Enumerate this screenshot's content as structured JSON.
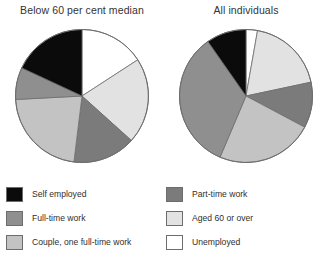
{
  "figure": {
    "background": "#ffffff"
  },
  "charts": [
    {
      "title": "Below 60 per cent median",
      "name": "pie-below-60-per-cent-median"
    },
    {
      "title": "All individuals",
      "name": "pie-all-individuals"
    }
  ],
  "legend": {
    "columns": [
      {
        "items": [
          {
            "label": "Self employed",
            "color": "#0b0b0b",
            "key": "self-employed"
          },
          {
            "label": "Full-time work",
            "color": "#8f8f8f",
            "key": "full-time-work"
          },
          {
            "label": "Couple, one full-time work",
            "color": "#c3c3c3",
            "key": "couple-one-full-time-work"
          }
        ]
      },
      {
        "items": [
          {
            "label": "Part-time work",
            "color": "#7b7b7b",
            "key": "part-time-work"
          },
          {
            "label": "Aged 60 or over",
            "color": "#e2e2e2",
            "key": "aged-60-or-over"
          },
          {
            "label": "Unemployed",
            "color": "#ffffff",
            "key": "unemployed"
          }
        ]
      }
    ]
  },
  "chart_data": {
    "type": "pie",
    "title": "",
    "legend_position": "bottom",
    "categories": [
      "Unemployed",
      "Aged 60 or over",
      "Part-time work",
      "Couple, one full-time work",
      "Full-time work",
      "Self employed"
    ],
    "colors": {
      "Self employed": "#0b0b0b",
      "Full-time work": "#8f8f8f",
      "Couple, one full-time work": "#c3c3c3",
      "Part-time work": "#7b7b7b",
      "Aged 60 or over": "#e2e2e2",
      "Unemployed": "#ffffff"
    },
    "series": [
      {
        "name": "Below 60 per cent median",
        "start_angle_deg": 0,
        "direction": "clockwise",
        "slice_angles_deg": [
          57,
          75,
          55,
          80,
          28,
          65
        ],
        "values_percent": [
          15.8,
          20.8,
          15.3,
          22.2,
          7.8,
          18.1
        ]
      },
      {
        "name": "All individuals",
        "start_angle_deg": 0,
        "direction": "clockwise",
        "slice_angles_deg": [
          10,
          68,
          40,
          85,
          122,
          35
        ],
        "values_percent": [
          2.8,
          18.9,
          11.1,
          23.6,
          33.9,
          9.7
        ]
      }
    ]
  }
}
